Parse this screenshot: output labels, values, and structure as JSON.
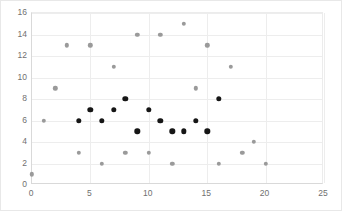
{
  "chart_data": {
    "type": "scatter",
    "title": "",
    "xlabel": "",
    "ylabel": "",
    "xlim": [
      0,
      25
    ],
    "ylim": [
      0,
      16
    ],
    "xticks": [
      0,
      5,
      10,
      15,
      20,
      25
    ],
    "yticks": [
      0,
      2,
      4,
      6,
      8,
      10,
      12,
      14,
      16
    ],
    "grid": true,
    "legend": "none",
    "series": [
      {
        "name": "gray-series",
        "color": "#9a9a9a",
        "marker": "circle",
        "points": [
          [
            0,
            1
          ],
          [
            1,
            6
          ],
          [
            2,
            9
          ],
          [
            3,
            13
          ],
          [
            4,
            3
          ],
          [
            5,
            13
          ],
          [
            6,
            2
          ],
          [
            7,
            11
          ],
          [
            8,
            3
          ],
          [
            9,
            14
          ],
          [
            10,
            3
          ],
          [
            11,
            14
          ],
          [
            12,
            2
          ],
          [
            13,
            15
          ],
          [
            14,
            9
          ],
          [
            15,
            13
          ],
          [
            16,
            2
          ],
          [
            17,
            11
          ],
          [
            18,
            3
          ],
          [
            19,
            4
          ],
          [
            20,
            2
          ]
        ]
      },
      {
        "name": "dark-series",
        "color": "#161616",
        "marker": "circle",
        "points": [
          [
            4,
            6
          ],
          [
            5,
            7
          ],
          [
            6,
            6
          ],
          [
            7,
            7
          ],
          [
            8,
            8
          ],
          [
            9,
            5
          ],
          [
            10,
            7
          ],
          [
            11,
            6
          ],
          [
            12,
            5
          ],
          [
            13,
            5
          ],
          [
            14,
            6
          ],
          [
            15,
            5
          ],
          [
            16,
            8
          ]
        ]
      }
    ]
  },
  "layout": {
    "plot": {
      "left": 30,
      "top": 11,
      "width": 292,
      "height": 172
    },
    "colors": {
      "background": "#ffffff",
      "grid": "#ededed",
      "axis": "#d9d9d9",
      "tick_text": "#707070",
      "frame": "#e8e8e8"
    }
  }
}
